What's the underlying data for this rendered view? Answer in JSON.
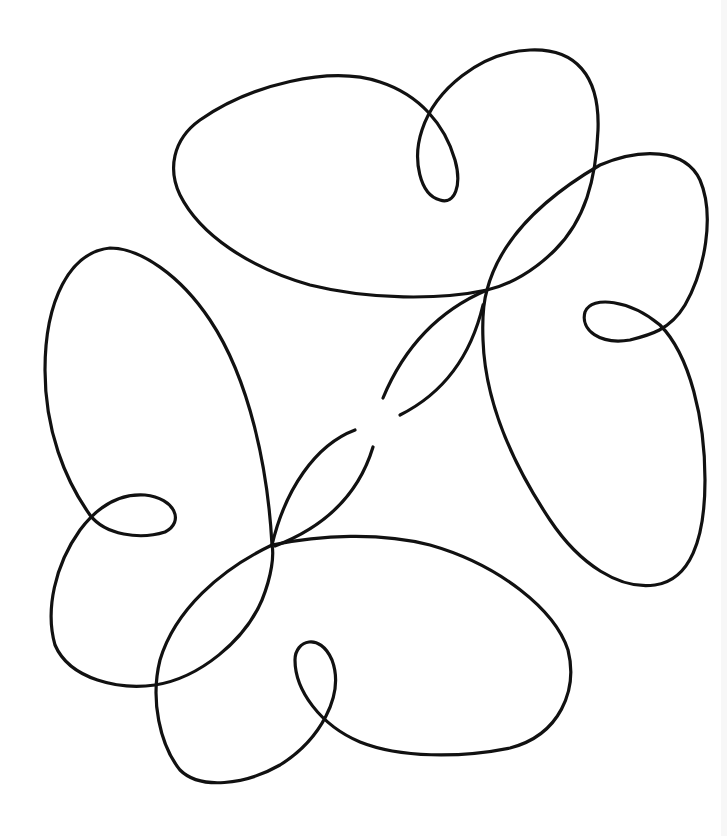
{
  "figure": {
    "background_color": "#ffffff",
    "stroke_color": "#111111",
    "lobes": [
      {
        "name": "top-lobe",
        "has_small_loop": true
      },
      {
        "name": "right-lobe",
        "has_small_loop": true
      },
      {
        "name": "bottom-lobe",
        "has_small_loop": true
      },
      {
        "name": "left-lobe",
        "has_small_loop": true
      }
    ]
  }
}
